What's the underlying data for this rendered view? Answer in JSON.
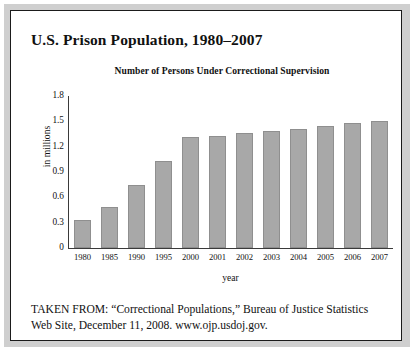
{
  "figure": {
    "title": "U.S. Prison Population, 1980–2007",
    "source_line_1": "TAKEN FROM: “Correctional Populations,” Bureau of Justice Statistics",
    "source_line_2": "Web Site, December 11, 2008. www.ojp.usdoj.gov.",
    "frame_color": "#1b1b1b",
    "bar_color": "#a8a8a8",
    "bar_border_color": "#8f8f8f",
    "axis_color": "#3a3a3a",
    "background": "#ffffff"
  },
  "chart_data": {
    "type": "bar",
    "title": "Number of Persons Under Correctional Supervision",
    "xlabel": "year",
    "ylabel": "in millions",
    "categories": [
      "1980",
      "1985",
      "1990",
      "1995",
      "2000",
      "2001",
      "2002",
      "2003",
      "2004",
      "2005",
      "2006",
      "2007"
    ],
    "values": [
      0.33,
      0.48,
      0.75,
      1.03,
      1.31,
      1.33,
      1.36,
      1.39,
      1.41,
      1.45,
      1.48,
      1.51
    ],
    "ylim": [
      0,
      1.8
    ],
    "yticks": [
      "1.8",
      "1.5",
      "1.2",
      "0.9",
      "0.6",
      "0.3",
      "0"
    ],
    "ytick_values": [
      1.8,
      1.5,
      1.2,
      0.9,
      0.6,
      0.3,
      0
    ],
    "grid": false,
    "legend": false
  }
}
